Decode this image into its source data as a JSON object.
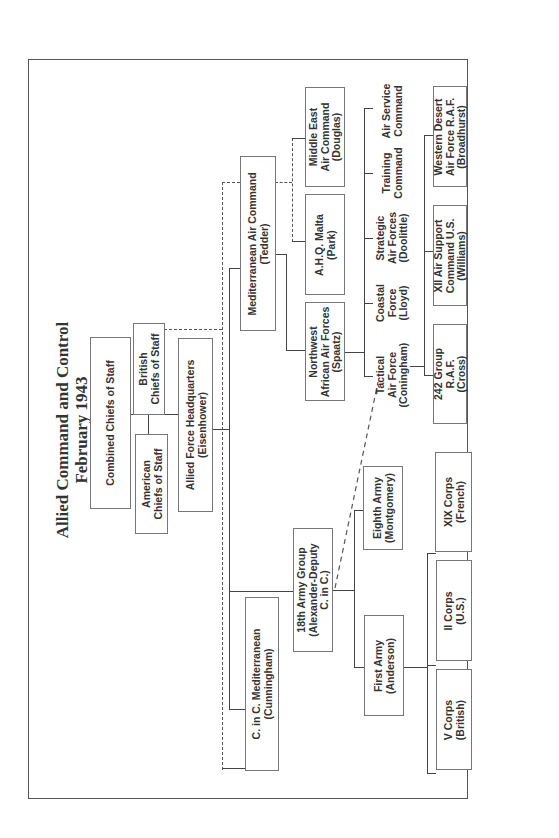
{
  "title": "Allied Command and Control\nFebruary 1943",
  "orientation": "rotated 90 degrees counter-clockwise",
  "nodes": {
    "combined_chiefs": "Combined Chiefs of Staff",
    "british_chiefs": "British\nChiefs of Staff",
    "american_chiefs": "American\nChiefs of Staff",
    "allied_force_hq": "Allied Force Headquarters\n(Eisenhower)",
    "med_air_command": "Mediterranean Air Command\n(Tedder)",
    "c_in_c_med": "C. in C. Mediterranean\n(Cunningham)",
    "army_group_18": "18th Army Group\n(Alexander-Deputy\nC. in C.)",
    "nw_african_af": "Northwest\nAfrican Air Forces\n(Spaatz)",
    "ahq_malta": "A.H.Q. Malta\n(Park)",
    "middle_east_ac": "Middle East\nAir Command\n(Douglas)",
    "tactical_af": "Tactical\nAir Force\n(Coningham)",
    "coastal_force": "Coastal\nForce\n(Lloyd)",
    "strategic_af": "Strategic\nAir Forces\n(Doolittle)",
    "training_command": "Training\nCommand",
    "air_service_command": "Air Service\nCommand",
    "group_242": "242 Group\nR.A.F.\n(Cross)",
    "xii_air_support": "XII Air Support\nCommand U.S.\n(Williams)",
    "western_desert_af": "Western Desert\nAir Force R.A.F.\n(Broadhurst)",
    "eighth_army": "Eighth Army\n(Montgomery)",
    "first_army": "First Army\n(Anderson)",
    "xix_corps": "XIX Corps\n(French)",
    "ii_corps": "II Corps\n(U.S.)",
    "v_corps": "V Corps\n(British)"
  },
  "edges": [
    {
      "from": "combined_chiefs",
      "to": "british_chiefs",
      "style": "solid"
    },
    {
      "from": "combined_chiefs",
      "to": "american_chiefs",
      "style": "solid"
    },
    {
      "from": "combined_chiefs",
      "to": "allied_force_hq",
      "style": "solid"
    },
    {
      "from": "allied_force_hq",
      "to": "med_air_command",
      "style": "solid"
    },
    {
      "from": "allied_force_hq",
      "to": "c_in_c_med",
      "style": "solid"
    },
    {
      "from": "allied_force_hq",
      "to": "army_group_18",
      "style": "solid"
    },
    {
      "from": "british_chiefs",
      "to": "c_in_c_med",
      "style": "dashed"
    },
    {
      "from": "british_chiefs",
      "to": "med_air_command",
      "style": "dashed"
    },
    {
      "from": "med_air_command",
      "to": "nw_african_af",
      "style": "solid"
    },
    {
      "from": "med_air_command",
      "to": "ahq_malta",
      "style": "dashed"
    },
    {
      "from": "med_air_command",
      "to": "middle_east_ac",
      "style": "dashed"
    },
    {
      "from": "nw_african_af",
      "to": "tactical_af",
      "style": "solid"
    },
    {
      "from": "nw_african_af",
      "to": "coastal_force",
      "style": "solid"
    },
    {
      "from": "nw_african_af",
      "to": "strategic_af",
      "style": "solid"
    },
    {
      "from": "nw_african_af",
      "to": "training_command",
      "style": "solid"
    },
    {
      "from": "nw_african_af",
      "to": "air_service_command",
      "style": "solid"
    },
    {
      "from": "tactical_af",
      "to": "group_242",
      "style": "solid"
    },
    {
      "from": "tactical_af",
      "to": "xii_air_support",
      "style": "solid"
    },
    {
      "from": "tactical_af",
      "to": "western_desert_af",
      "style": "solid"
    },
    {
      "from": "army_group_18",
      "to": "tactical_af",
      "style": "dashed"
    },
    {
      "from": "army_group_18",
      "to": "eighth_army",
      "style": "solid"
    },
    {
      "from": "army_group_18",
      "to": "first_army",
      "style": "solid"
    },
    {
      "from": "first_army",
      "to": "xix_corps",
      "style": "solid"
    },
    {
      "from": "first_army",
      "to": "ii_corps",
      "style": "solid"
    },
    {
      "from": "first_army",
      "to": "v_corps",
      "style": "solid"
    }
  ]
}
